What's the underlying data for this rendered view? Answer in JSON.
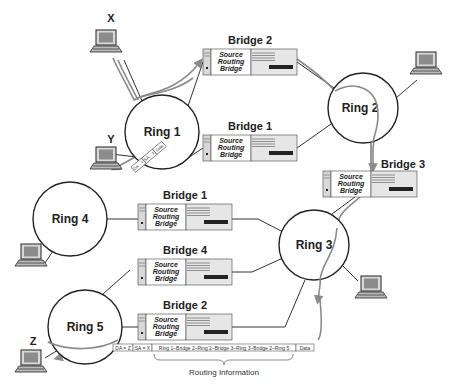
{
  "rings": [
    {
      "id": "ring1",
      "label": "Ring 1",
      "cx": 162,
      "cy": 132,
      "r": 37
    },
    {
      "id": "ring2",
      "label": "Ring 2",
      "cx": 363,
      "cy": 108,
      "r": 35
    },
    {
      "id": "ring3",
      "label": "Ring 3",
      "cx": 314,
      "cy": 245,
      "r": 35
    },
    {
      "id": "ring4",
      "label": "Ring 4",
      "cx": 70,
      "cy": 219,
      "r": 37
    },
    {
      "id": "ring5",
      "label": "Ring 5",
      "cx": 85,
      "cy": 327,
      "r": 37
    }
  ],
  "bridges": [
    {
      "id": "top-bridge2",
      "title": "Bridge 2",
      "line1": "Source",
      "line2": "Routing",
      "line3": "Bridge",
      "x": 203,
      "y": 49
    },
    {
      "id": "top-bridge1",
      "title": "Bridge 1",
      "line1": "Source",
      "line2": "Routing",
      "line3": "Bridge",
      "x": 203,
      "y": 135
    },
    {
      "id": "bridge3",
      "title": "Bridge 3",
      "line1": "Source",
      "line2": "Routing",
      "line3": "Bridge",
      "x": 323,
      "y": 171
    },
    {
      "id": "bot-bridge1",
      "title": "Bridge 1",
      "line1": "Source",
      "line2": "Routing",
      "line3": "Bridge",
      "x": 138,
      "y": 204
    },
    {
      "id": "bridge4",
      "title": "Bridge 4",
      "line1": "Source",
      "line2": "Routing",
      "line3": "Bridge",
      "x": 138,
      "y": 259
    },
    {
      "id": "bot-bridge2",
      "title": "Bridge 2",
      "line1": "Source",
      "line2": "Routing",
      "line3": "Bridge",
      "x": 138,
      "y": 314
    }
  ],
  "stations": [
    {
      "id": "x",
      "label": "X",
      "x": 92,
      "y": 28
    },
    {
      "id": "y",
      "label": "Y",
      "x": 92,
      "y": 148
    },
    {
      "id": "ring2-station",
      "label": "",
      "x": 410,
      "y": 50
    },
    {
      "id": "ring4-station",
      "label": "",
      "x": 15,
      "y": 242
    },
    {
      "id": "ring3-station",
      "label": "",
      "x": 355,
      "y": 276
    },
    {
      "id": "z",
      "label": "Z",
      "x": 12,
      "y": 350
    }
  ],
  "small_frame": {
    "fields": [
      "DA = Y",
      "SA = X",
      "Data"
    ]
  },
  "frame": {
    "da": "DA = Z",
    "sa": "SA = X",
    "route": "Ring 1–Bridge 2–Ring 2–Bridge 3–Ring 3–Bridge 2–Ring 5",
    "data": "Data",
    "caption": "Routing Information"
  },
  "colors": {
    "line": "#333333",
    "ring": "#222222",
    "path": "#8a8a8a",
    "bridge_fill": "#e6e6e6",
    "bridge_panel": "#ffffff",
    "slot": "#222222"
  }
}
